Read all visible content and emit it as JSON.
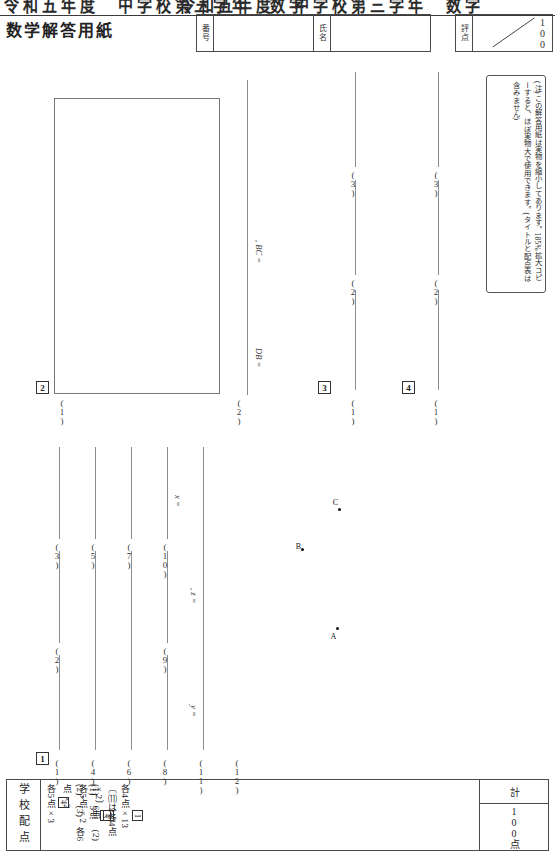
{
  "page": {
    "cropped_header_fragment": "令和五年度　中学校第三学年　数学",
    "title": "数学解答用紙"
  },
  "header": {
    "id_label": "番号",
    "id_value": "",
    "name_label": "氏名",
    "name_value": "",
    "score_label": "評点",
    "score_value": "",
    "score_max": "100"
  },
  "note": {
    "text": "(注)この解答用紙は実物を縮小してあります。185%拡大コピーすると、ほぼ実物大で使用できます。(タイトルと配点表は含みません)"
  },
  "sections": [
    {
      "number": "1",
      "items": [
        {
          "label": "(1)"
        },
        {
          "label": "(2)"
        },
        {
          "label": "(3)"
        },
        {
          "label": "(4)"
        },
        {
          "label": "(5)"
        },
        {
          "label": "(6)"
        },
        {
          "label": "(7)"
        },
        {
          "label": "(8)"
        },
        {
          "label": "(9)"
        },
        {
          "label": "(10)",
          "prefix": "x ="
        },
        {
          "label": "(11)",
          "prefix": "y =",
          "suffix": ", z ="
        },
        {
          "label": "(12)"
        }
      ]
    },
    {
      "number": "2",
      "items": [
        {
          "label": "(1)",
          "kind": "workbox"
        },
        {
          "label": "(2)",
          "prefix": "DB =",
          "suffix": ", BC ="
        }
      ]
    },
    {
      "number": "3",
      "items": [
        {
          "label": "(1)"
        },
        {
          "label": "(2)"
        },
        {
          "label": "(3)"
        }
      ]
    },
    {
      "number": "4",
      "items": [
        {
          "label": "(1)"
        },
        {
          "label": "(2)"
        },
        {
          "label": "(3)"
        }
      ]
    }
  ],
  "diagram": {
    "points": [
      {
        "label": "A"
      },
      {
        "label": "B"
      },
      {
        "label": "C"
      }
    ]
  },
  "allocation": {
    "heading": "学校配点",
    "rows": [
      {
        "chip": "1",
        "text": "各4点×13 〔⑾は各4点×2〕"
      },
      {
        "chip": "2",
        "text": "(1)　6点　(2)　各5点×2"
      },
      {
        "chip": "3",
        "text": "(1)　5点　(2)，(3)　各6点×2"
      },
      {
        "chip": "4",
        "text": "各5点×3"
      }
    ],
    "total_label": "計",
    "total_value": "100点"
  }
}
